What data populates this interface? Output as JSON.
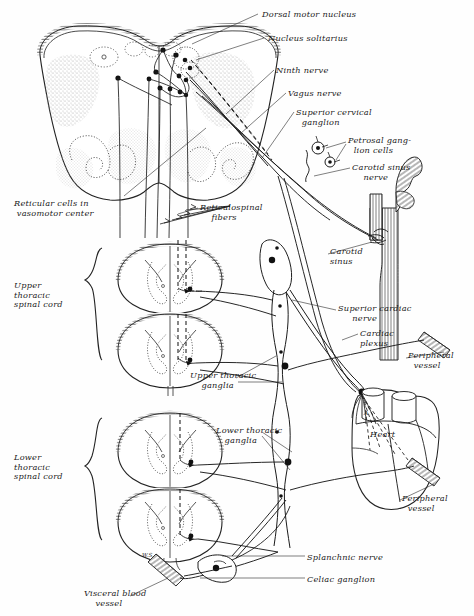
{
  "figure": {
    "signature": "W.S.",
    "ink_color": "#1a1a1a",
    "paper_color": "#fefefe",
    "stipple_color": "#8a8a8a"
  },
  "labels": [
    {
      "id": "dorsal-motor-nucleus",
      "text": "Dorsal motor nucleus",
      "x": 262,
      "y": 10,
      "align": "left"
    },
    {
      "id": "nucleus-solitarius",
      "text": "Nucleus solitarius",
      "x": 268,
      "y": 34,
      "align": "left"
    },
    {
      "id": "ninth-nerve",
      "text": "Ninth nerve",
      "x": 276,
      "y": 66,
      "align": "left"
    },
    {
      "id": "vagus-nerve",
      "text": "Vagus nerve",
      "x": 288,
      "y": 89,
      "align": "left"
    },
    {
      "id": "superior-cervical-ganglion",
      "text": "Superior cervical\n  ganglion",
      "x": 296,
      "y": 108,
      "align": "left"
    },
    {
      "id": "petrosal-ganglion-cells",
      "text": "Petrosal gang-\n  lion cells",
      "x": 348,
      "y": 136,
      "align": "left"
    },
    {
      "id": "carotid-sinus-nerve",
      "text": "Carotid sinus\n    nerve",
      "x": 352,
      "y": 163,
      "align": "left"
    },
    {
      "id": "reticular-cells-vasomotor",
      "text": "Reticular cells in\n vasomotor center",
      "x": 14,
      "y": 199,
      "align": "left"
    },
    {
      "id": "reticulospinal-fibers",
      "text": "Reticulospinal\n    fibers",
      "x": 200,
      "y": 203,
      "align": "left"
    },
    {
      "id": "carotid-sinus",
      "text": "Carotid\nsinus",
      "x": 330,
      "y": 247,
      "align": "left"
    },
    {
      "id": "upper-thoracic-spinal-cord",
      "text": "Upper\nthoracic\nspinal cord",
      "x": 14,
      "y": 281,
      "align": "left"
    },
    {
      "id": "superior-cardiac-nerve",
      "text": "Superior cardiac\n     nerve",
      "x": 338,
      "y": 304,
      "align": "left"
    },
    {
      "id": "cardiac-plexus",
      "text": "Cardiac\nplexus",
      "x": 360,
      "y": 329,
      "align": "left"
    },
    {
      "id": "peripheral-vessel-upper",
      "text": "Peripheral\n  vessel",
      "x": 408,
      "y": 351,
      "align": "left"
    },
    {
      "id": "upper-thoracic-ganglia",
      "text": "Upper thoracic\n    ganglia",
      "x": 190,
      "y": 371,
      "align": "left"
    },
    {
      "id": "lower-thoracic-ganglia",
      "text": "Lower thoracic\n   ganglia",
      "x": 216,
      "y": 426,
      "align": "left"
    },
    {
      "id": "heart",
      "text": "Heart",
      "x": 370,
      "y": 430,
      "align": "left"
    },
    {
      "id": "lower-thoracic-spinal-cord",
      "text": "Lower\nthoracic\nspinal cord",
      "x": 14,
      "y": 453,
      "align": "left"
    },
    {
      "id": "peripheral-vessel-lower",
      "text": "Peripheral\n  vessel",
      "x": 402,
      "y": 494,
      "align": "left"
    },
    {
      "id": "splanchnic-nerve",
      "text": "Splanchnic nerve",
      "x": 307,
      "y": 553,
      "align": "left"
    },
    {
      "id": "celiac-ganglion",
      "text": "Celiac ganglion",
      "x": 307,
      "y": 575,
      "align": "left"
    },
    {
      "id": "visceral-blood-vessel",
      "text": "Visceral blood\n    vessel",
      "x": 84,
      "y": 589,
      "align": "left"
    }
  ],
  "structures": {
    "medulla": "medulla-oblongata-cross-section",
    "cord_sections": [
      "upper-thoracic-1",
      "upper-thoracic-2",
      "lower-thoracic-1",
      "lower-thoracic-2"
    ],
    "organs": [
      "heart",
      "carotid-artery",
      "peripheral-vessel-upper",
      "peripheral-vessel-lower",
      "visceral-blood-vessel"
    ],
    "ganglia": [
      "superior-cervical-ganglion",
      "petrosal-ganglion",
      "upper-thoracic-ganglia",
      "lower-thoracic-ganglia",
      "celiac-ganglion"
    ],
    "nerves": [
      "ninth-nerve",
      "vagus-nerve",
      "carotid-sinus-nerve",
      "superior-cardiac-nerve",
      "splanchnic-nerve",
      "reticulospinal-fibers"
    ]
  }
}
